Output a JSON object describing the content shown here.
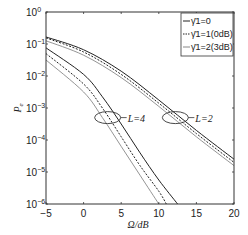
{
  "chart_data": {
    "type": "line",
    "title": "",
    "xlabel": "Ω/dB",
    "ylabel": "Pe",
    "xlim": [
      -5,
      20
    ],
    "ylim": [
      1e-06,
      1
    ],
    "yscale": "log",
    "grid": false,
    "legend_position": "upper right",
    "x_ticks": [
      -5,
      0,
      5,
      10,
      15,
      20
    ],
    "x_tick_labels": [
      "−5",
      "0",
      "5",
      "10",
      "15",
      "20"
    ],
    "y_ticks": [
      0,
      -1,
      -2,
      -3,
      -4,
      -5,
      -6
    ],
    "y_tick_labels": [
      "10^0",
      "10^-1",
      "10^-2",
      "10^-3",
      "10^-4",
      "10^-5",
      "10^-6"
    ],
    "legend": [
      {
        "label": "γ̄1=0",
        "style": "solid",
        "color": "#222222"
      },
      {
        "label": "γ̄1=1(0dB)",
        "style": "dotted",
        "color": "#222222"
      },
      {
        "label": "γ̄1=2(3dB)",
        "style": "solid",
        "color": "#888888"
      }
    ],
    "annotations": [
      {
        "text": "L=4",
        "ellipse_center": [
          3.2,
          -3.3
        ]
      },
      {
        "text": "L=2",
        "ellipse_center": [
          12.2,
          -3.3
        ]
      }
    ],
    "series": [
      {
        "name": "L=2, γ̄1=0",
        "group": "L=2",
        "style": "solid",
        "color": "#222222",
        "x": [
          -5,
          0,
          5,
          10,
          15,
          20
        ],
        "log10_y": [
          -0.78,
          -1.18,
          -1.85,
          -2.75,
          -3.7,
          -4.6
        ]
      },
      {
        "name": "L=2, γ̄1=1(0dB)",
        "group": "L=2",
        "style": "dotted",
        "color": "#222222",
        "x": [
          -5,
          0,
          5,
          10,
          15,
          20
        ],
        "log10_y": [
          -0.81,
          -1.25,
          -1.95,
          -2.85,
          -3.8,
          -4.7
        ]
      },
      {
        "name": "L=2, γ̄1=2(3dB)",
        "group": "L=2",
        "style": "solid",
        "color": "#888888",
        "x": [
          -5,
          0,
          5,
          10,
          15,
          20
        ],
        "log10_y": [
          -0.9,
          -1.35,
          -2.05,
          -2.95,
          -3.9,
          -4.8
        ]
      },
      {
        "name": "L=4, γ̄1=0",
        "group": "L=4",
        "style": "solid",
        "color": "#222222",
        "x": [
          -5,
          0,
          2.5,
          5,
          7.5,
          10,
          12.5
        ],
        "log10_y": [
          -1.12,
          -1.95,
          -2.65,
          -3.5,
          -4.4,
          -5.25,
          -6.0
        ]
      },
      {
        "name": "L=4, γ̄1=1(0dB)",
        "group": "L=4",
        "style": "dotted",
        "color": "#222222",
        "x": [
          -5,
          0,
          2.5,
          5,
          7.5,
          10,
          11
        ],
        "log10_y": [
          -1.3,
          -2.25,
          -3.0,
          -3.9,
          -4.8,
          -5.6,
          -6.0
        ]
      },
      {
        "name": "L=4, γ̄1=2(3dB)",
        "group": "L=4",
        "style": "solid",
        "color": "#888888",
        "x": [
          -5,
          0,
          2.5,
          5,
          7.5,
          10
        ],
        "log10_y": [
          -1.5,
          -2.5,
          -3.3,
          -4.2,
          -5.1,
          -6.0
        ]
      }
    ]
  }
}
